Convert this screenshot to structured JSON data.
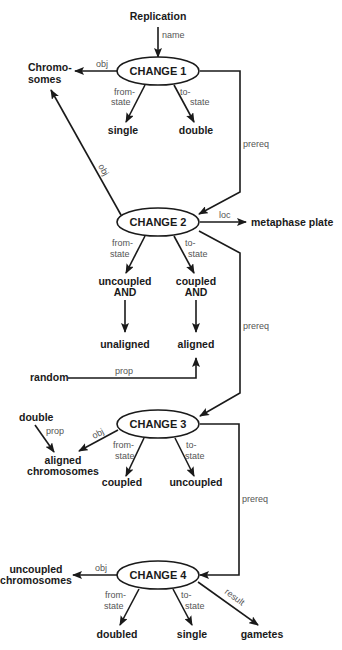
{
  "diagram": {
    "nodes": {
      "replication": "Replication",
      "chromosomes_1": "Chromo-",
      "chromosomes_2": "somes",
      "change1": "CHANGE 1",
      "single1": "single",
      "double1": "double",
      "change2": "CHANGE 2",
      "metaphase_plate": "metaphase plate",
      "uncoupled_and_1": "uncoupled",
      "uncoupled_and_2": "AND",
      "coupled_and_1": "coupled",
      "coupled_and_2": "AND",
      "unaligned": "unaligned",
      "aligned": "aligned",
      "random": "random",
      "double3": "double",
      "aligned_chromosomes_1": "aligned",
      "aligned_chromosomes_2": "chromosomes",
      "change3": "CHANGE 3",
      "coupled3": "coupled",
      "uncoupled3": "uncoupled",
      "uncoupled_chromosomes_1": "uncoupled",
      "uncoupled_chromosomes_2": "chromosomes",
      "change4": "CHANGE 4",
      "doubled4": "doubled",
      "single4": "single",
      "gametes": "gametes"
    },
    "labels": {
      "name": "name",
      "obj": "obj",
      "from": "from-",
      "state": "state",
      "to": "to-",
      "prereq": "prereq",
      "loc": "loc",
      "prop": "prop",
      "result": "result"
    }
  }
}
